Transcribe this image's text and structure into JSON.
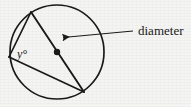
{
  "figure": {
    "kind": "geometry-diagram",
    "background_color": "#f4f4f2",
    "ink_color": "#1a1a1a",
    "labels": {
      "angle": "y°",
      "diameter": "diameter"
    },
    "circle": {
      "center_x": 57,
      "center_y": 52,
      "radius": 47,
      "stroke_width": 1.6
    },
    "center_dot": {
      "cx": 57,
      "cy": 52,
      "r": 3.1
    },
    "vertices": {
      "top": {
        "x": 31,
        "y": 12
      },
      "left": {
        "x": 9,
        "y": 57
      },
      "bottom_right": {
        "x": 84,
        "y": 92
      }
    },
    "chords": [
      {
        "name": "diameter-chord",
        "x1": 31,
        "y1": 12,
        "x2": 84,
        "y2": 92
      },
      {
        "name": "chord-top-left",
        "x1": 31,
        "y1": 12,
        "x2": 9,
        "y2": 57
      },
      {
        "name": "chord-left-bottomright",
        "x1": 9,
        "y1": 57,
        "x2": 84,
        "y2": 92
      }
    ],
    "leader": {
      "tip_x": 60,
      "tip_y": 38,
      "tail_x": 133,
      "tail_y": 31,
      "arrowhead": true
    },
    "angle_label_pos": {
      "x": 17,
      "y": 57,
      "font_size": 11
    },
    "diameter_label_pos": {
      "x": 137,
      "y": 35,
      "font_size": 12
    }
  }
}
